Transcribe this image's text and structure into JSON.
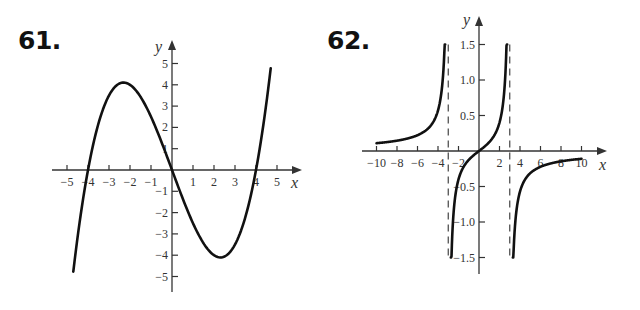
{
  "problems": [
    {
      "number": "61."
    },
    {
      "number": "62."
    }
  ],
  "chart_data": [
    {
      "type": "line",
      "title": "61.",
      "xlabel": "x",
      "ylabel": "y",
      "xlim": [
        -5,
        5
      ],
      "ylim": [
        -5,
        5
      ],
      "x_ticks": [
        -5,
        -4,
        -3,
        -2,
        -1,
        1,
        2,
        3,
        4,
        5
      ],
      "x_tick_labels": [
        "−5",
        "−4",
        "−3",
        "−2",
        "−1",
        "1",
        "2",
        "3",
        "4",
        "5"
      ],
      "y_ticks": [
        5,
        4,
        3,
        2,
        1,
        -1,
        -2,
        -3,
        -4,
        -5
      ],
      "y_tick_labels": [
        "5",
        "4",
        "3",
        "2",
        "1",
        "−1",
        "−2",
        "−3",
        "−4",
        "−5"
      ],
      "grid": false,
      "series": [
        {
          "name": "f(x)",
          "description": "cubic through (-4,0), (0,0), (4,0); local max ≈ (-2.3, 4.1), local min ≈ (2.3, -4.1)",
          "x": [
            -4.7,
            -4.5,
            -4,
            -3.5,
            -3,
            -2.5,
            -2.3,
            -2,
            -1.5,
            -1,
            -0.5,
            0,
            0.5,
            1,
            1.5,
            2,
            2.3,
            2.5,
            3,
            3.5,
            4,
            4.5,
            4.7
          ],
          "y": [
            -4.77,
            -3.19,
            0,
            2.19,
            3.5,
            4.06,
            4.1,
            4.0,
            3.44,
            2.5,
            1.31,
            0,
            -1.31,
            -2.5,
            -3.44,
            -4.0,
            -4.1,
            -4.06,
            -3.5,
            -2.19,
            0,
            3.19,
            4.77
          ]
        }
      ]
    },
    {
      "type": "line",
      "title": "62.",
      "xlabel": "x",
      "ylabel": "y",
      "xlim": [
        -10,
        10
      ],
      "ylim": [
        -1.5,
        1.5
      ],
      "x_ticks": [
        -10,
        -8,
        -6,
        -4,
        -2,
        2,
        4,
        6,
        8,
        10
      ],
      "x_tick_labels": [
        "−10",
        "−8",
        "−6",
        "−4",
        "−2",
        "2",
        "4",
        "6",
        "8",
        "10"
      ],
      "y_ticks": [
        1.5,
        1.0,
        0.5,
        -0.5,
        -1.0,
        -1.5
      ],
      "y_tick_labels": [
        "1.5",
        "1.0",
        "0.5",
        "−0.5",
        "−1.0",
        "−1.5"
      ],
      "grid": false,
      "vertical_asymptotes": [
        -3,
        3
      ],
      "asymptote_style": "dashed",
      "series": [
        {
          "name": "left branch",
          "x": [
            -10,
            -9,
            -8,
            -7,
            -6,
            -5,
            -4,
            -3.5,
            -3.3
          ],
          "y": [
            0.11,
            0.125,
            0.145,
            0.175,
            0.222,
            0.313,
            0.571,
            1.077,
            1.75
          ]
        },
        {
          "name": "middle branch",
          "x": [
            -2.75,
            -2.5,
            -2,
            -1.5,
            -1,
            -0.5,
            0,
            0.5,
            1,
            1.5,
            2,
            2.5,
            2.75
          ],
          "y": [
            -1.913,
            -0.909,
            -0.4,
            -0.222,
            -0.125,
            -0.057,
            0,
            0.057,
            0.125,
            0.222,
            0.4,
            0.909,
            1.913
          ]
        },
        {
          "name": "right branch",
          "x": [
            3.3,
            3.5,
            4,
            5,
            6,
            7,
            8,
            9,
            10
          ],
          "y": [
            -1.75,
            -1.077,
            -0.571,
            -0.313,
            -0.222,
            -0.175,
            -0.145,
            -0.125,
            -0.11
          ]
        }
      ]
    }
  ]
}
